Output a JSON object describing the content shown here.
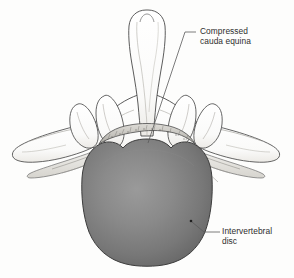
{
  "figure": {
    "type": "medical-illustration",
    "view": "axial cross-section of lumbar vertebra with herniated intervertebral disc",
    "background_color": "#fdfdfc"
  },
  "labels": {
    "cauda_equina": {
      "text": "Compressed\ncauda equina",
      "line1": "Compressed",
      "line2": "cauda equina",
      "color": "#2e2e2e"
    },
    "intervertebral_disc": {
      "text": "Intervertebral\ndisc",
      "line1": "Intervertebral",
      "line2": "disc",
      "color": "#2e2e2e"
    }
  },
  "structures": {
    "spinous_process": "spinous-process",
    "lamina": "lamina",
    "transverse_process_left": "transverse-process-left",
    "transverse_process_right": "transverse-process-right",
    "superior_articular_process_left": "superior-articular-process-left",
    "superior_articular_process_right": "superior-articular-process-right",
    "nerve_root_left": "nerve-root-left",
    "nerve_root_right": "nerve-root-right",
    "cauda_equina": "compressed-cauda-equina",
    "disc": "intervertebral-disc"
  },
  "colors": {
    "outline": "#4a4a4a",
    "bone_fill": "#fefefe",
    "bone_shadow": "#e4e4e2",
    "disc_center": "#8e8e8e",
    "disc_mid": "#767676",
    "disc_edge": "#5e5e5e",
    "disc_outline": "#3d3d3d",
    "cauda_fill": "#c9c7c2",
    "nerve_fill": "#dedcd7",
    "leader_line": "#5a5a5a",
    "text": "#2e2e2e"
  },
  "leader_lines": {
    "cauda_equina": {
      "from_x": 196,
      "from_y": 32,
      "to_x": 148,
      "to_y": 143
    },
    "intervertebral_disc": {
      "from_x": 218,
      "from_y": 232,
      "to_x": 192,
      "to_y": 222
    }
  }
}
